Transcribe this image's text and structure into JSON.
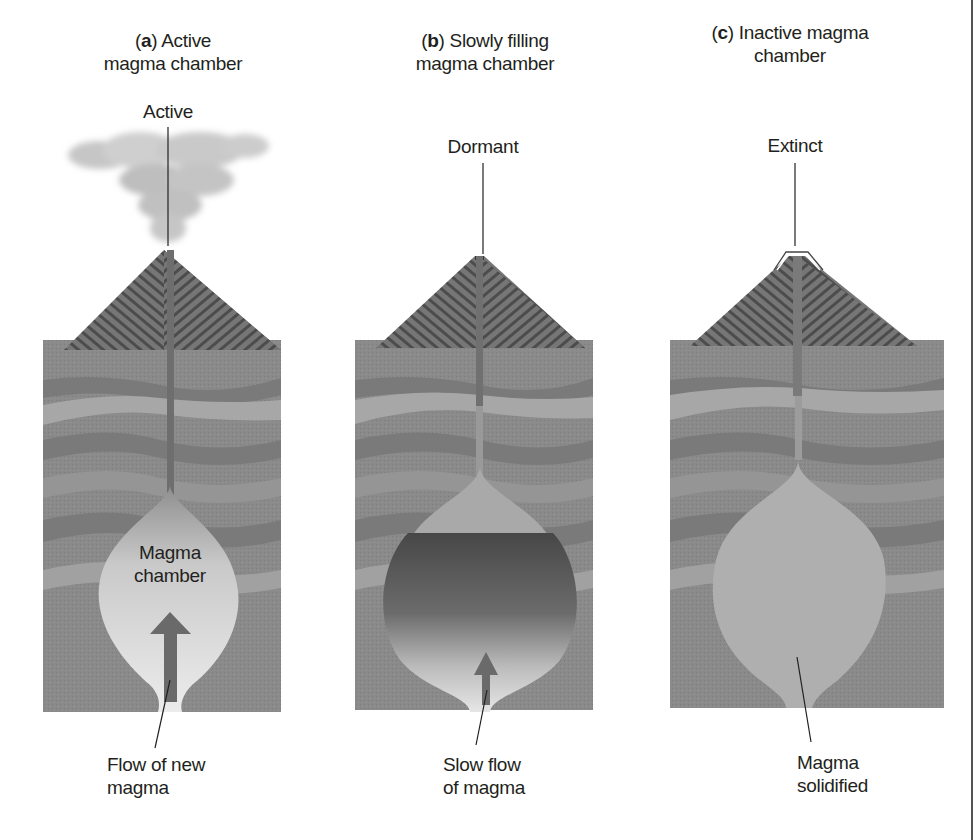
{
  "figure": {
    "panels": [
      {
        "id": "a",
        "letter": "a",
        "title_rest_line1": " Active",
        "title_line2": "magma chamber",
        "state_label": "Active",
        "chamber_label_line1": "Magma",
        "chamber_label_line2": "chamber",
        "bottom_label_line1": "Flow of new",
        "bottom_label_line2": "magma"
      },
      {
        "id": "b",
        "letter": "b",
        "title_rest_line1": " Slowly filling",
        "title_line2": "magma chamber",
        "state_label": "Dormant",
        "bottom_label_line1": "Slow flow",
        "bottom_label_line2": "of magma"
      },
      {
        "id": "c",
        "letter": "c",
        "title_rest_line1": " Inactive magma",
        "title_line2": "chamber",
        "state_label": "Extinct",
        "bottom_label_line1": "Magma",
        "bottom_label_line2": "solidified"
      }
    ],
    "colors": {
      "background": "#ffffff",
      "crust": "#8a8a8a",
      "crust_dark": "#7a7a7a",
      "crust_light_band": "#a8a8a8",
      "cone": "#6e6e6e",
      "cone_stripe": "#4a4a4a",
      "conduit": "#707070",
      "magma_light": "#e6e6e6",
      "magma_mid": "#bdbdbd",
      "magma_dark": "#4e4e4e",
      "solidified": "#b0b0b0",
      "arrow": "#6a6a6a",
      "ash_cloud": "#c8c8c8",
      "text": "#231f20"
    }
  }
}
